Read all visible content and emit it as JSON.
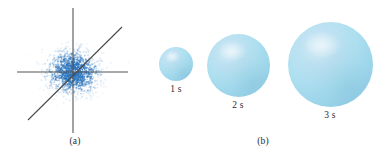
{
  "figure": {
    "background_color": "#ffffff",
    "panels": [
      {
        "id": "a",
        "caption": "(a)",
        "type": "scatter-with-axes",
        "description": "dense blue point cloud centered at origin with horizontal and vertical axes and a diagonal line"
      },
      {
        "id": "b",
        "caption": "(b)",
        "type": "growing-spheres",
        "description": "three light blue spheres of increasing radius labeled by elapsed time"
      }
    ]
  },
  "colors": {
    "point_cloud": "#2b74bd",
    "axis_line": "#555555",
    "diagonal_line": "#4a4a4a",
    "sphere_fill": "#ade0f0",
    "sphere_highlight": "#d8eef8",
    "sphere_shadow": "#8ac7e0",
    "label_text": "#2b2b2b"
  },
  "chart_data": {
    "type": "scatter",
    "title": "",
    "xlabel": "",
    "ylabel": "",
    "grid": false,
    "legend": null,
    "axes": {
      "horizontal_axis": {
        "x_start": 17,
        "x_end": 128,
        "y": 72
      },
      "vertical_axis": {
        "x": 73,
        "y_start": 8,
        "y_end": 133
      },
      "diagonal_line": {
        "x1": 28,
        "y1": 120,
        "x2": 122,
        "y2": 27,
        "slope": 1
      }
    },
    "cloud": {
      "center_x": 73,
      "center_y": 72,
      "n_points": 1400,
      "sigma_x": 13,
      "sigma_y": 11,
      "color": "#2b74bd"
    }
  },
  "spheres": [
    {
      "label": "1 s",
      "time_seconds": 1,
      "center_x": 176,
      "center_y": 64,
      "diameter": 34
    },
    {
      "label": "2 s",
      "time_seconds": 2,
      "center_x": 238,
      "center_y": 65,
      "diameter": 63
    },
    {
      "label": "3 s",
      "time_seconds": 3,
      "center_x": 330,
      "center_y": 64,
      "diameter": 85
    }
  ],
  "captions": {
    "panel_a": "(a)",
    "panel_b": "(b)"
  }
}
